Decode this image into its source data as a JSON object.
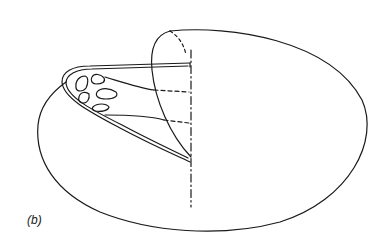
{
  "figure": {
    "panel_label": "(b)",
    "stroke_color": "#1a1a1a",
    "background": "#ffffff"
  }
}
